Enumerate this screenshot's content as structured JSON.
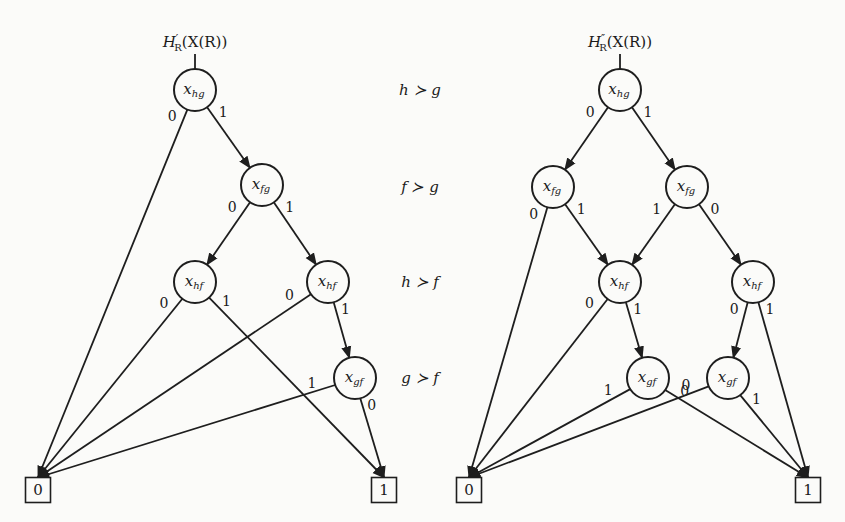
{
  "figure": {
    "left": {
      "title": {
        "main": "H",
        "prime": "′",
        "sub": "R",
        "arg": "(X(R))"
      },
      "nodes": [
        {
          "id": "L_hg",
          "var": "x",
          "sub": "hg",
          "cx": 195,
          "cy": 90
        },
        {
          "id": "L_fg",
          "var": "x",
          "sub": "fg",
          "cx": 262,
          "cy": 185
        },
        {
          "id": "L_hf1",
          "var": "x",
          "sub": "hf",
          "cx": 195,
          "cy": 282
        },
        {
          "id": "L_hf2",
          "var": "x",
          "sub": "hf",
          "cx": 328,
          "cy": 282
        },
        {
          "id": "L_gf",
          "var": "x",
          "sub": "gf",
          "cx": 355,
          "cy": 378
        }
      ],
      "terminals": [
        {
          "id": "L_0",
          "label": "0",
          "cx": 38,
          "cy": 490
        },
        {
          "id": "L_1",
          "label": "1",
          "cx": 384,
          "cy": 490
        }
      ],
      "edges": [
        {
          "from": "L_hg",
          "to": "L_0",
          "label": "0"
        },
        {
          "from": "L_hg",
          "to": "L_fg",
          "label": "1"
        },
        {
          "from": "L_fg",
          "to": "L_hf1",
          "label": "0"
        },
        {
          "from": "L_fg",
          "to": "L_hf2",
          "label": "1"
        },
        {
          "from": "L_hf1",
          "to": "L_0",
          "label": "0"
        },
        {
          "from": "L_hf1",
          "to": "L_1",
          "label": "1"
        },
        {
          "from": "L_hf2",
          "to": "L_0",
          "label": "0"
        },
        {
          "from": "L_hf2",
          "to": "L_gf",
          "label": "1"
        },
        {
          "from": "L_gf",
          "to": "L_0",
          "label": "1"
        },
        {
          "from": "L_gf",
          "to": "L_1",
          "label": "0"
        }
      ]
    },
    "right": {
      "title": {
        "main": "H",
        "prime": "″",
        "sub": "R",
        "arg": "(X(R))"
      },
      "nodes": [
        {
          "id": "R_hg",
          "var": "x",
          "sub": "hg",
          "cx": 620,
          "cy": 90
        },
        {
          "id": "R_fg1",
          "var": "x",
          "sub": "fg",
          "cx": 553,
          "cy": 187
        },
        {
          "id": "R_fg2",
          "var": "x",
          "sub": "fg",
          "cx": 687,
          "cy": 187
        },
        {
          "id": "R_hf1",
          "var": "x",
          "sub": "hf",
          "cx": 620,
          "cy": 282
        },
        {
          "id": "R_hf2",
          "var": "x",
          "sub": "hf",
          "cx": 753,
          "cy": 282
        },
        {
          "id": "R_gf1",
          "var": "x",
          "sub": "gf",
          "cx": 648,
          "cy": 378
        },
        {
          "id": "R_gf2",
          "var": "x",
          "sub": "gf",
          "cx": 728,
          "cy": 378
        }
      ],
      "terminals": [
        {
          "id": "R_0",
          "label": "0",
          "cx": 469,
          "cy": 490
        },
        {
          "id": "R_1",
          "label": "1",
          "cx": 808,
          "cy": 490
        }
      ],
      "edges": [
        {
          "from": "R_hg",
          "to": "R_fg1",
          "label": "0"
        },
        {
          "from": "R_hg",
          "to": "R_fg2",
          "label": "1"
        },
        {
          "from": "R_fg1",
          "to": "R_0",
          "label": "0"
        },
        {
          "from": "R_fg1",
          "to": "R_hf1",
          "label": "1"
        },
        {
          "from": "R_fg2",
          "to": "R_hf1",
          "label": "1"
        },
        {
          "from": "R_fg2",
          "to": "R_hf2",
          "label": "0"
        },
        {
          "from": "R_hf1",
          "to": "R_0",
          "label": "0"
        },
        {
          "from": "R_hf1",
          "to": "R_gf1",
          "label": "1"
        },
        {
          "from": "R_hf2",
          "to": "R_gf2",
          "label": "0"
        },
        {
          "from": "R_hf2",
          "to": "R_1",
          "label": "1"
        },
        {
          "from": "R_gf1",
          "to": "R_0",
          "label": "1"
        },
        {
          "from": "R_gf1",
          "to": "R_1",
          "label": "0"
        },
        {
          "from": "R_gf2",
          "to": "R_0",
          "label": "0"
        },
        {
          "from": "R_gf2",
          "to": "R_1",
          "label": "1"
        }
      ]
    },
    "orderings": [
      {
        "a": "h",
        "b": "g",
        "y": 90
      },
      {
        "a": "f",
        "b": "g",
        "y": 187
      },
      {
        "a": "h",
        "b": "f",
        "y": 282
      },
      {
        "a": "g",
        "b": "f",
        "y": 378
      }
    ],
    "succ_symbol": "≻"
  }
}
